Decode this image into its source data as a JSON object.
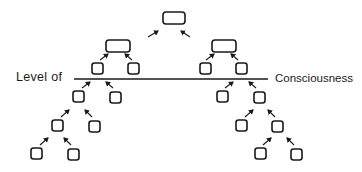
{
  "diagram": {
    "type": "hierarchy",
    "labels": {
      "left": "Level of",
      "right": "Consciousness"
    },
    "consciousness_line": {
      "x1": 74,
      "x2": 268,
      "y": 79
    },
    "colors": {
      "stroke": "#1a1a1a",
      "background": "#ffffff"
    },
    "nodes": [
      {
        "id": "top",
        "x": 163,
        "y": 12,
        "w": 22,
        "h": 12,
        "shape": "rounded-rect"
      },
      {
        "id": "mid-left",
        "x": 106,
        "y": 40,
        "w": 24,
        "h": 12,
        "shape": "rounded-rect"
      },
      {
        "id": "mid-right",
        "x": 212,
        "y": 40,
        "w": 24,
        "h": 12,
        "shape": "rounded-rect"
      },
      {
        "id": "L1a",
        "x": 92,
        "y": 63,
        "w": 11,
        "h": 11
      },
      {
        "id": "L1b",
        "x": 128,
        "y": 63,
        "w": 11,
        "h": 11
      },
      {
        "id": "R1a",
        "x": 200,
        "y": 63,
        "w": 11,
        "h": 11
      },
      {
        "id": "R1b",
        "x": 236,
        "y": 63,
        "w": 11,
        "h": 11
      },
      {
        "id": "L2a",
        "x": 73,
        "y": 91,
        "w": 11,
        "h": 11
      },
      {
        "id": "L2b",
        "x": 110,
        "y": 92,
        "w": 11,
        "h": 11
      },
      {
        "id": "R2a",
        "x": 217,
        "y": 91,
        "w": 11,
        "h": 11
      },
      {
        "id": "R2b",
        "x": 254,
        "y": 92,
        "w": 11,
        "h": 11
      },
      {
        "id": "L3a",
        "x": 52,
        "y": 120,
        "w": 11,
        "h": 11
      },
      {
        "id": "L3b",
        "x": 89,
        "y": 121,
        "w": 11,
        "h": 11
      },
      {
        "id": "R3a",
        "x": 236,
        "y": 120,
        "w": 11,
        "h": 11
      },
      {
        "id": "R3b",
        "x": 272,
        "y": 121,
        "w": 11,
        "h": 11
      },
      {
        "id": "L4a",
        "x": 31,
        "y": 148,
        "w": 11,
        "h": 11
      },
      {
        "id": "L4b",
        "x": 68,
        "y": 149,
        "w": 11,
        "h": 11
      },
      {
        "id": "R4a",
        "x": 255,
        "y": 148,
        "w": 11,
        "h": 11
      },
      {
        "id": "R4b",
        "x": 291,
        "y": 149,
        "w": 11,
        "h": 11
      }
    ],
    "arrows": [
      {
        "from": [
          148,
          37
        ],
        "to": [
          158,
          31
        ]
      },
      {
        "from": [
          190,
          37
        ],
        "to": [
          181,
          31
        ]
      },
      {
        "from": [
          100,
          60
        ],
        "to": [
          108,
          54
        ]
      },
      {
        "from": [
          132,
          60
        ],
        "to": [
          125,
          54
        ]
      },
      {
        "from": [
          206,
          60
        ],
        "to": [
          214,
          54
        ]
      },
      {
        "from": [
          238,
          60
        ],
        "to": [
          231,
          54
        ]
      },
      {
        "from": [
          82,
          88
        ],
        "to": [
          90,
          82
        ]
      },
      {
        "from": [
          113,
          88
        ],
        "to": [
          106,
          82
        ]
      },
      {
        "from": [
          225,
          88
        ],
        "to": [
          233,
          82
        ]
      },
      {
        "from": [
          256,
          88
        ],
        "to": [
          249,
          82
        ]
      },
      {
        "from": [
          61,
          117
        ],
        "to": [
          69,
          110
        ]
      },
      {
        "from": [
          92,
          117
        ],
        "to": [
          85,
          110
        ]
      },
      {
        "from": [
          245,
          117
        ],
        "to": [
          253,
          110
        ]
      },
      {
        "from": [
          275,
          117
        ],
        "to": [
          268,
          110
        ]
      },
      {
        "from": [
          40,
          145
        ],
        "to": [
          48,
          138
        ]
      },
      {
        "from": [
          71,
          145
        ],
        "to": [
          64,
          138
        ]
      },
      {
        "from": [
          263,
          145
        ],
        "to": [
          271,
          138
        ]
      },
      {
        "from": [
          294,
          145
        ],
        "to": [
          287,
          138
        ]
      }
    ]
  }
}
